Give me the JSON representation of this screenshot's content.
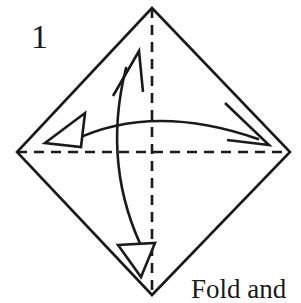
{
  "figure": {
    "step_number": "1",
    "caption": "Fold and",
    "ink_color": "#1a1a1a",
    "background_color": "#ffffff",
    "shape": {
      "name": "square-rotated-diamond",
      "vertices": {
        "top": [
          152,
          8
        ],
        "right": [
          290,
          152
        ],
        "bottom": [
          152,
          295
        ],
        "left": [
          17,
          152
        ]
      }
    },
    "creases": [
      {
        "name": "horizontal-crease",
        "style": "dashed",
        "from": [
          17,
          152
        ],
        "to": [
          290,
          152
        ]
      },
      {
        "name": "vertical-crease",
        "style": "dashed",
        "from": [
          152,
          8
        ],
        "to": [
          152,
          295
        ]
      }
    ],
    "arrows": [
      {
        "name": "horizontal-fold-arrow",
        "direction": "left-to-right",
        "arc_apex": [
          152,
          113
        ],
        "start": [
          72,
          141
        ],
        "end": [
          258,
          139
        ],
        "head_start": "open-triangle",
        "head_end": "open-vee"
      },
      {
        "name": "vertical-fold-arrow",
        "direction": "bottom-to-top",
        "arc_apex": [
          113,
          165
        ],
        "start": [
          146,
          256
        ],
        "end": [
          126,
          68
        ],
        "head_start": "open-triangle",
        "head_end": "open-vee"
      }
    ]
  }
}
